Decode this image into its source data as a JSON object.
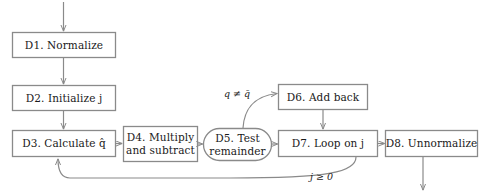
{
  "diagram": {
    "colors": {
      "node_border": "#8a8a8a",
      "node_fill": "#ffffff",
      "edge": "#8a8a8a",
      "text": "#1a1a1a",
      "background": "#ffffff"
    },
    "nodes": [
      {
        "id": "D1",
        "label": "D1. Normalize",
        "shape": "rect",
        "x": 12,
        "y": 32,
        "w": 104,
        "h": 26
      },
      {
        "id": "D2",
        "label": "D2. Initialize j",
        "shape": "rect",
        "x": 12,
        "y": 85,
        "w": 104,
        "h": 26
      },
      {
        "id": "D3",
        "label": "D3. Calculate q̂",
        "shape": "rect",
        "x": 12,
        "y": 130,
        "w": 104,
        "h": 27
      },
      {
        "id": "D4",
        "label": "D4. Multiply\nand subtract",
        "shape": "rect",
        "x": 123,
        "y": 126,
        "w": 75,
        "h": 36
      },
      {
        "id": "D5",
        "label": "D5. Test\nremainder",
        "shape": "stadium",
        "x": 203,
        "y": 128,
        "w": 69,
        "h": 33
      },
      {
        "id": "D6",
        "label": "D6. Add back",
        "shape": "rect",
        "x": 278,
        "y": 84,
        "w": 90,
        "h": 26
      },
      {
        "id": "D7",
        "label": "D7. Loop on j",
        "shape": "rect",
        "x": 278,
        "y": 130,
        "w": 100,
        "h": 27
      },
      {
        "id": "D8",
        "label": "D8. Unnormalize",
        "shape": "rect",
        "x": 385,
        "y": 130,
        "w": 93,
        "h": 27
      }
    ],
    "edge_labels": [
      {
        "id": "q-not-equal",
        "text": "q ≠ q̄",
        "x": 224,
        "y": 88
      },
      {
        "id": "j-ge-zero",
        "text": "j ≥ 0",
        "x": 310,
        "y": 171
      }
    ],
    "edges": [
      {
        "id": "entry-to-d1",
        "from": "start",
        "to": "D1"
      },
      {
        "id": "d1-to-d2",
        "from": "D1",
        "to": "D2"
      },
      {
        "id": "d2-to-d3",
        "from": "D2",
        "to": "D3"
      },
      {
        "id": "d3-to-d4",
        "from": "D3",
        "to": "D4"
      },
      {
        "id": "d4-to-d5",
        "from": "D4",
        "to": "D5"
      },
      {
        "id": "d5-to-d6",
        "from": "D5",
        "to": "D6",
        "label": "q ≠ q̄"
      },
      {
        "id": "d5-to-d7",
        "from": "D5",
        "to": "D7"
      },
      {
        "id": "d6-to-d7",
        "from": "D6",
        "to": "D7"
      },
      {
        "id": "d7-to-d8",
        "from": "D7",
        "to": "D8"
      },
      {
        "id": "d7-to-d3",
        "from": "D7",
        "to": "D3",
        "label": "j ≥ 0"
      },
      {
        "id": "d8-to-exit",
        "from": "D8",
        "to": "end"
      }
    ]
  }
}
